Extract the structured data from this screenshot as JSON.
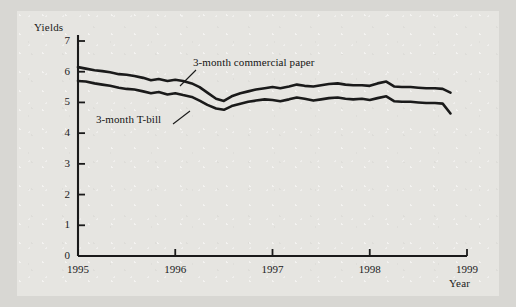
{
  "chart_data": {
    "type": "line",
    "title": "",
    "subtitle": "",
    "xlabel": "Year",
    "ylabel": "Yields",
    "xlim": [
      1995,
      1999
    ],
    "ylim": [
      0,
      7
    ],
    "grid": false,
    "legend_position": "inline-annotation",
    "yticks": [
      0,
      1,
      2,
      3,
      4,
      5,
      6,
      7
    ],
    "ytick_labels": [
      "0",
      "1",
      "2",
      "3",
      "4",
      "5",
      "6",
      "7"
    ],
    "xticks": [
      1995,
      1996,
      1997,
      1998,
      1999
    ],
    "xtick_labels": [
      "1995",
      "1996",
      "1997",
      "1998",
      "1999"
    ],
    "annotations": [
      {
        "text": "3-month commercial paper",
        "series": "3-month commercial paper"
      },
      {
        "text": "3-month T-bill",
        "series": "3-month T-bill"
      }
    ],
    "series": [
      {
        "name": "3-month commercial paper",
        "color": "#1a1a1a",
        "x": [
          1995.0,
          1995.08,
          1995.17,
          1995.25,
          1995.33,
          1995.42,
          1995.5,
          1995.58,
          1995.67,
          1995.75,
          1995.83,
          1995.92,
          1996.0,
          1996.08,
          1996.17,
          1996.25,
          1996.33,
          1996.42,
          1996.5,
          1996.58,
          1996.67,
          1996.75,
          1996.83,
          1996.92,
          1997.0,
          1997.08,
          1997.17,
          1997.25,
          1997.33,
          1997.42,
          1997.5,
          1997.58,
          1997.67,
          1997.75,
          1997.83,
          1997.92,
          1998.0,
          1998.08,
          1998.17,
          1998.25,
          1998.33,
          1998.42,
          1998.5,
          1998.58,
          1998.67,
          1998.75,
          1998.83
        ],
        "values": [
          6.15,
          6.1,
          6.05,
          6.02,
          5.98,
          5.92,
          5.9,
          5.86,
          5.8,
          5.72,
          5.76,
          5.7,
          5.74,
          5.7,
          5.62,
          5.5,
          5.32,
          5.12,
          5.05,
          5.2,
          5.3,
          5.36,
          5.42,
          5.46,
          5.5,
          5.46,
          5.52,
          5.58,
          5.54,
          5.52,
          5.56,
          5.6,
          5.62,
          5.58,
          5.56,
          5.56,
          5.54,
          5.62,
          5.68,
          5.52,
          5.5,
          5.5,
          5.48,
          5.46,
          5.46,
          5.44,
          5.32
        ]
      },
      {
        "name": "3-month T-bill",
        "color": "#1a1a1a",
        "x": [
          1995.0,
          1995.08,
          1995.17,
          1995.25,
          1995.33,
          1995.42,
          1995.5,
          1995.58,
          1995.67,
          1995.75,
          1995.83,
          1995.92,
          1996.0,
          1996.08,
          1996.17,
          1996.25,
          1996.33,
          1996.42,
          1996.5,
          1996.58,
          1996.67,
          1996.75,
          1996.83,
          1996.92,
          1997.0,
          1997.08,
          1997.17,
          1997.25,
          1997.33,
          1997.42,
          1997.5,
          1997.58,
          1997.67,
          1997.75,
          1997.83,
          1997.92,
          1998.0,
          1998.08,
          1998.17,
          1998.25,
          1998.33,
          1998.42,
          1998.5,
          1998.58,
          1998.67,
          1998.75,
          1998.83
        ],
        "values": [
          5.7,
          5.68,
          5.62,
          5.58,
          5.54,
          5.48,
          5.44,
          5.42,
          5.36,
          5.3,
          5.34,
          5.26,
          5.3,
          5.24,
          5.18,
          5.06,
          4.92,
          4.8,
          4.76,
          4.88,
          4.96,
          5.02,
          5.06,
          5.1,
          5.08,
          5.04,
          5.1,
          5.16,
          5.12,
          5.06,
          5.1,
          5.14,
          5.16,
          5.12,
          5.1,
          5.12,
          5.08,
          5.14,
          5.2,
          5.04,
          5.02,
          5.02,
          5.0,
          4.98,
          4.98,
          4.96,
          4.64
        ]
      }
    ]
  }
}
